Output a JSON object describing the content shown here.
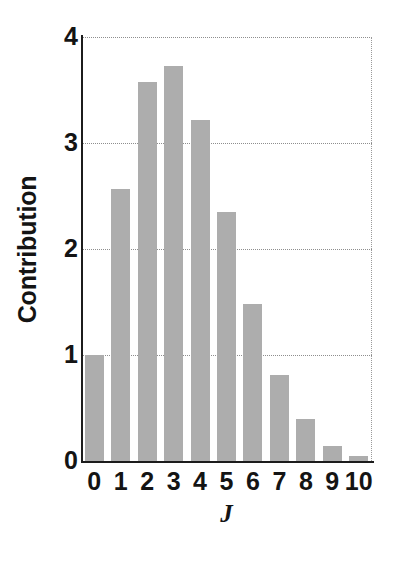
{
  "chart_data": {
    "type": "bar",
    "title": "",
    "subtitle": "",
    "xlabel": "J",
    "ylabel": "Contribution",
    "categories": [
      "0",
      "1",
      "2",
      "3",
      "4",
      "5",
      "6",
      "7",
      "8",
      "9",
      "10"
    ],
    "values": [
      1.0,
      2.57,
      3.58,
      3.73,
      3.22,
      2.35,
      1.48,
      0.81,
      0.4,
      0.14,
      0.05
    ],
    "series": [
      {
        "name": "Contribution",
        "values": [
          1.0,
          2.57,
          3.58,
          3.73,
          3.22,
          2.35,
          1.48,
          0.81,
          0.4,
          0.14,
          0.05
        ]
      }
    ],
    "xlim": [
      -0.5,
      10.5
    ],
    "ylim": [
      0,
      4
    ],
    "ytick_labels": [
      "0",
      "1",
      "2",
      "3",
      "4"
    ],
    "ytick_values": [
      0,
      1,
      2,
      3,
      4
    ],
    "xtick_labels": [
      "0",
      "1",
      "2",
      "3",
      "4",
      "5",
      "6",
      "7",
      "8",
      "9",
      "10"
    ],
    "grid": "horizontal-dotted",
    "legend": "none",
    "annotations": [],
    "bar_color": "#adadad",
    "axis_color": "#1c1c1c",
    "grid_color": "#8e8e8e",
    "background_color": "#ffffff"
  }
}
